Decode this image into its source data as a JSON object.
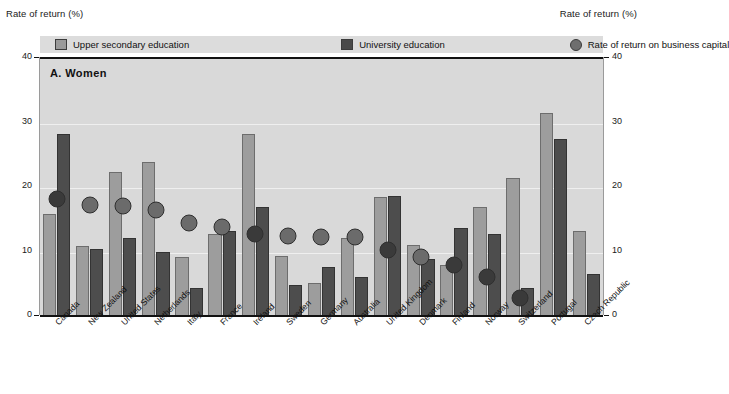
{
  "figure": {
    "left_axis_caption": "Rate of return (%)",
    "right_axis_caption": "Rate of return (%)",
    "panel_title": "A.  Women"
  },
  "legend": {
    "items": [
      {
        "label": "Upper secondary education",
        "icon": "light-square-swatch",
        "color": "#9d9d9d"
      },
      {
        "label": "University education",
        "icon": "dark-square-swatch",
        "color": "#4d4d4d"
      },
      {
        "label": "Rate of return on business capital",
        "icon": "gray-circle-marker",
        "color": "#6b6b6b"
      }
    ]
  },
  "chart_data": {
    "type": "bar",
    "title": "A.  Women",
    "xlabel": "",
    "ylabel": "Rate of return (%)",
    "ylim": [
      0,
      40
    ],
    "yticks": [
      0,
      10,
      20,
      30,
      40
    ],
    "grid": true,
    "legend_position": "top",
    "categories": [
      "Canada",
      "New Zealand",
      "United States",
      "Netherlands",
      "Italy",
      "France",
      "Ireland",
      "Sweden",
      "Germany",
      "Australia",
      "United Kingdom",
      "Denmark",
      "Finland",
      "Norway",
      "Switzerland",
      "Portugal",
      "Czech Republic"
    ],
    "series": [
      {
        "name": "Upper secondary education",
        "type": "bar",
        "color": "#9d9d9d",
        "values": [
          16.0,
          11.0,
          22.5,
          24.0,
          9.3,
          12.8,
          28.4,
          9.5,
          5.2,
          12.2,
          18.6,
          11.2,
          8.0,
          17.0,
          21.6,
          31.6,
          13.4
        ]
      },
      {
        "name": "University education",
        "type": "bar",
        "color": "#4d4d4d",
        "values": [
          28.3,
          10.6,
          12.3,
          10.1,
          4.5,
          13.3,
          17.0,
          5.0,
          7.8,
          6.2,
          18.8,
          9.0,
          13.8,
          12.9,
          4.5,
          27.6,
          6.6
        ]
      },
      {
        "name": "Rate of return on business capital",
        "type": "scatter",
        "color": "#6b6b6b",
        "values": [
          19.4,
          18.5,
          18.3,
          17.8,
          15.8,
          15.1,
          14.1,
          13.8,
          13.5,
          13.5,
          11.5,
          10.5,
          9.3,
          7.3,
          4.1,
          null,
          null
        ]
      }
    ]
  }
}
